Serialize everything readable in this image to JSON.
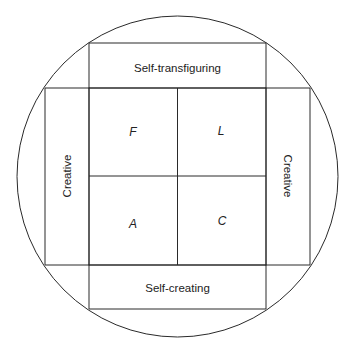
{
  "diagram": {
    "outer_shape": "circle",
    "top_band": {
      "label": "Self-transfiguring"
    },
    "bottom_band": {
      "label": "Self-creating"
    },
    "left_band": {
      "label": "Creative"
    },
    "right_band": {
      "label": "Creative"
    },
    "quadrants": {
      "top_left": "F",
      "top_right": "L",
      "bottom_left": "A",
      "bottom_right": "C"
    }
  }
}
